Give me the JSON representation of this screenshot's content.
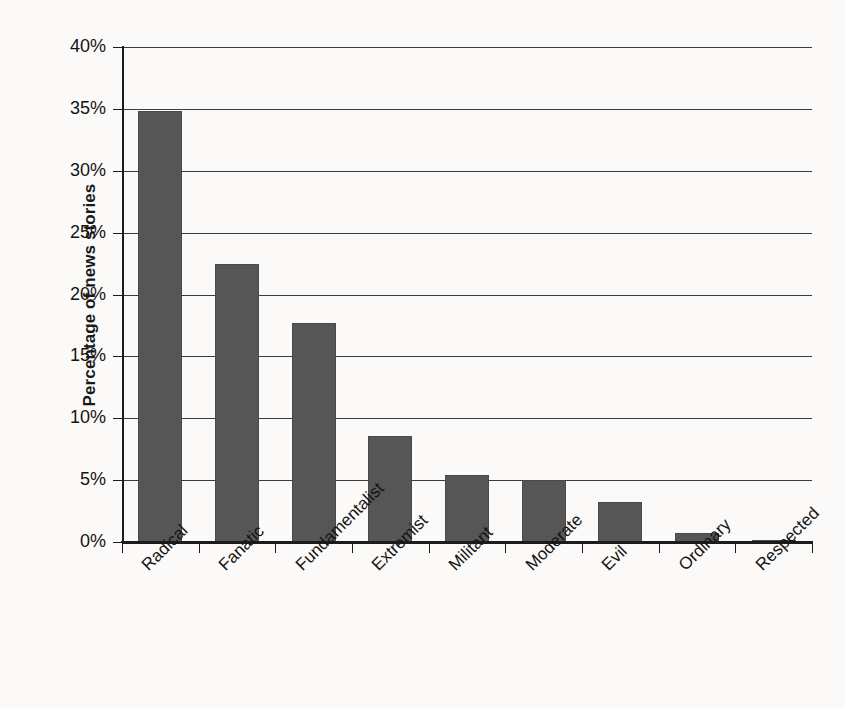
{
  "chart_data": {
    "type": "bar",
    "title": "",
    "xlabel": "",
    "ylabel": "Percentage of news stories",
    "categories": [
      "Radical",
      "Fanatic",
      "Fundamentalist",
      "Extremist",
      "Militant",
      "Moderate",
      "Evil",
      "Ordinary",
      "Respected"
    ],
    "values": [
      34.8,
      22.5,
      17.7,
      8.6,
      5.4,
      5.0,
      3.2,
      0.7,
      0.15
    ],
    "value_unit": "percent",
    "ylim": [
      0,
      40
    ],
    "ytick_labels": [
      "0%",
      "5%",
      "10%",
      "15%",
      "20%",
      "25%",
      "30%",
      "35%",
      "40%"
    ],
    "ytick_values": [
      0,
      5,
      10,
      15,
      20,
      25,
      30,
      35,
      40
    ],
    "grid": true,
    "grid_axis": "y",
    "legend": false,
    "legend_position": "none",
    "xtick_label_rotation": -45,
    "bar_color": "#565656",
    "axis_color": "#1c1c1c",
    "background_color": "#fbfaf8"
  }
}
